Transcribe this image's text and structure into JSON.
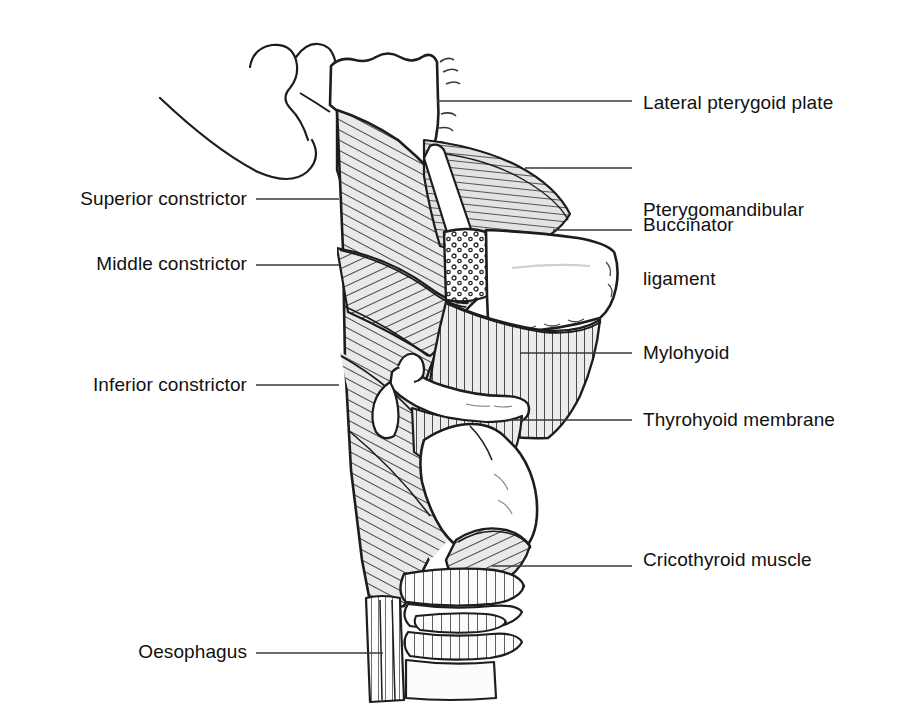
{
  "figure": {
    "width": 906,
    "height": 706,
    "background": "#ffffff",
    "ink_color": "#1a1a1a",
    "muscle_fill": "#e9e9e9",
    "bone_fill": "#ffffff",
    "leader_color": "#3a3a3a"
  },
  "labels": {
    "lateral_pterygoid_plate": "Lateral pterygoid plate",
    "pterygomandibular_ligament_line1": "Pterygomandibular",
    "pterygomandibular_ligament_line2": "ligament",
    "buccinator": "Buccinator",
    "mylohyoid": "Mylohyoid",
    "thyrohyoid_membrane": "Thyrohyoid membrane",
    "cricothyroid_muscle": "Cricothyroid muscle",
    "superior_constrictor": "Superior constrictor",
    "middle_constrictor": "Middle constrictor",
    "inferior_constrictor": "Inferior constrictor",
    "oesophagus": "Oesophagus"
  },
  "callouts": [
    {
      "name": "lateral-pterygoid-plate",
      "side": "right",
      "text_x": 643,
      "text_y": 91,
      "leader_x1": 437,
      "leader_x2": 632,
      "leader_y": 101
    },
    {
      "name": "pterygomandibular-ligament",
      "side": "right",
      "text_x": 643,
      "text_y": 152,
      "leader_x1": 525,
      "leader_x2": 632,
      "leader_y": 168
    },
    {
      "name": "buccinator",
      "side": "right",
      "text_x": 643,
      "text_y": 213,
      "leader_x1": 553,
      "leader_x2": 632,
      "leader_y": 230
    },
    {
      "name": "mylohyoid",
      "side": "right",
      "text_x": 643,
      "text_y": 341,
      "leader_x1": 520,
      "leader_x2": 632,
      "leader_y": 353
    },
    {
      "name": "thyrohyoid-membrane",
      "side": "right",
      "text_x": 643,
      "text_y": 408,
      "leader_x1": 508,
      "leader_x2": 632,
      "leader_y": 420
    },
    {
      "name": "cricothyroid-muscle",
      "side": "right",
      "text_x": 643,
      "text_y": 548,
      "leader_x1": 492,
      "leader_x2": 632,
      "leader_y": 566
    },
    {
      "name": "superior-constrictor",
      "side": "left",
      "text_right": 247,
      "text_y": 187,
      "leader_x1": 256,
      "leader_x2": 339,
      "leader_y": 199
    },
    {
      "name": "middle-constrictor",
      "side": "left",
      "text_right": 247,
      "text_y": 252,
      "leader_x1": 256,
      "leader_x2": 339,
      "leader_y": 265
    },
    {
      "name": "inferior-constrictor",
      "side": "left",
      "text_right": 247,
      "text_y": 373,
      "leader_x1": 256,
      "leader_x2": 339,
      "leader_y": 385
    },
    {
      "name": "oesophagus",
      "side": "left",
      "text_right": 247,
      "text_y": 640,
      "leader_x1": 256,
      "leader_x2": 383,
      "leader_y": 653
    }
  ],
  "structures": [
    {
      "name": "pterygoid-hamulus-hook",
      "kind": "bone-outline",
      "fill": "#ffffff"
    },
    {
      "name": "skull-base",
      "kind": "bone",
      "fill": "#ffffff"
    },
    {
      "name": "superior-constrictor-muscle",
      "kind": "muscle",
      "hatch": "diagonal",
      "fill": "#e9e9e9"
    },
    {
      "name": "buccinator-muscle",
      "kind": "muscle",
      "hatch": "horizontal",
      "fill": "#e2e2e2"
    },
    {
      "name": "pterygomandibular-raphe-band",
      "kind": "ligament",
      "fill": "#ffffff"
    },
    {
      "name": "mandible-body",
      "kind": "bone",
      "fill": "#ffffff",
      "cut_surface": "stippled"
    },
    {
      "name": "mylohyoid-muscle",
      "kind": "muscle",
      "hatch": "vertical",
      "fill": "#e9e9e9"
    },
    {
      "name": "middle-constrictor-muscle",
      "kind": "muscle",
      "hatch": "diagonal",
      "fill": "#e9e9e9"
    },
    {
      "name": "hyoid-bone",
      "kind": "bone",
      "fill": "#ffffff"
    },
    {
      "name": "thyrohyoid-membrane-sheet",
      "kind": "membrane",
      "hatch": "vertical",
      "fill": "#ececec"
    },
    {
      "name": "thyroid-cartilage",
      "kind": "cartilage",
      "fill": "#ffffff"
    },
    {
      "name": "inferior-constrictor-muscle",
      "kind": "muscle",
      "hatch": "diagonal",
      "fill": "#e9e9e9"
    },
    {
      "name": "cricothyroid-muscle-body",
      "kind": "muscle",
      "hatch": "diagonal",
      "fill": "#e9e9e9"
    },
    {
      "name": "cricoid-cartilage",
      "kind": "cartilage",
      "fill": "#ffffff"
    },
    {
      "name": "tracheal-rings",
      "kind": "cartilage",
      "count": 3,
      "fill": "#fbfbfb"
    },
    {
      "name": "oesophagus-tube",
      "kind": "muscle",
      "hatch": "vertical",
      "fill": "#ffffff"
    }
  ]
}
